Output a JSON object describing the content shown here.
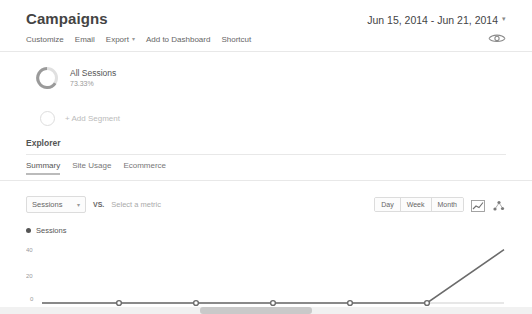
{
  "header": {
    "title": "Campaigns",
    "date_range": "Jun 15, 2014 - Jun 21, 2014",
    "date_caret": "▾"
  },
  "action_bar": {
    "items": [
      {
        "label": "Customize",
        "caret": false
      },
      {
        "label": "Email",
        "caret": false
      },
      {
        "label": "Export",
        "caret": true
      },
      {
        "label": "Add to Dashboard",
        "caret": false
      },
      {
        "label": "Shortcut",
        "caret": false
      }
    ],
    "eye_icon": "eye-icon"
  },
  "segments": {
    "primary": {
      "title": "All Sessions",
      "percent": "73.33%",
      "donut_icon": "donut-chart-icon"
    },
    "add_segment_label": "+ Add Segment",
    "add_segment_icon": "empty-circle-icon"
  },
  "explorer": {
    "title": "Explorer",
    "tabs": [
      {
        "label": "Summary",
        "active": true
      },
      {
        "label": "Site Usage",
        "active": false
      },
      {
        "label": "Ecommerce",
        "active": false
      }
    ]
  },
  "metric_row": {
    "primary_metric": "Sessions",
    "primary_caret": "▾",
    "vs_label": "VS.",
    "secondary_placeholder": "Select a metric",
    "granularity": [
      {
        "label": "Day",
        "active": false
      },
      {
        "label": "Week",
        "active": false
      },
      {
        "label": "Month",
        "active": false
      }
    ],
    "chart_type_icons": [
      "line-chart-icon",
      "scatter-chart-icon"
    ]
  },
  "legend": {
    "series_label": "Sessions",
    "dot_color": "#555555"
  },
  "chart_data": {
    "type": "line",
    "title": "Sessions",
    "xlabel": "",
    "ylabel": "",
    "categories": [
      "Jun 15",
      "Jun 16",
      "Jun 17",
      "Jun 18",
      "Jun 19",
      "Jun 20",
      "Jun 21"
    ],
    "x_tick_labels": [
      "Jun 16",
      "Jun 17",
      "Jun 18",
      "Jun 19",
      "Jun 20"
    ],
    "y_ticks": [
      0,
      20,
      40
    ],
    "ylim": [
      0,
      45
    ],
    "grid": false,
    "legend_position": "top-left",
    "series": [
      {
        "name": "Sessions",
        "color": "#6b6b6b",
        "values": [
          0,
          0,
          0,
          0,
          0,
          0,
          40
        ]
      }
    ],
    "point_markers": [
      {
        "x": "Jun 16",
        "y": 0
      },
      {
        "x": "Jun 17",
        "y": 0
      },
      {
        "x": "Jun 18",
        "y": 0
      },
      {
        "x": "Jun 19",
        "y": 0
      },
      {
        "x": "Jun 20",
        "y": 0
      }
    ]
  },
  "scrollbar": {
    "name": "horizontal-scrollbar"
  }
}
